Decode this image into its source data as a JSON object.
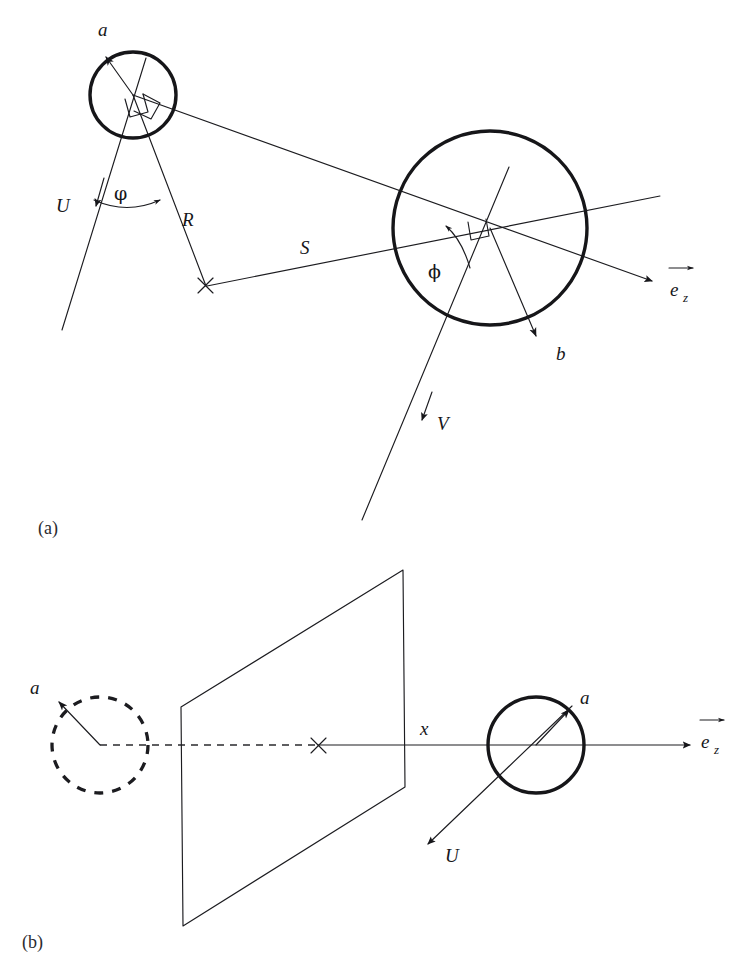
{
  "figure": {
    "type": "diagram",
    "background_color": "#ffffff",
    "ink_color": "#16161a"
  },
  "panels": [
    {
      "id": "a",
      "caption": "(a)",
      "caption_pos": {
        "x": 52,
        "y": 534
      },
      "elements": {
        "small_circle": {
          "cx": 133,
          "cy": 95,
          "r": 43,
          "style": "solid-thick"
        },
        "large_circle": {
          "cx": 490,
          "cy": 228,
          "r": 97,
          "style": "solid-thick"
        },
        "cross_marker": {
          "x": 205,
          "y": 285,
          "size": 9
        },
        "vector_a": {
          "from": [
            133,
            95
          ],
          "to": [
            104,
            55
          ],
          "label": "a",
          "label_pos": {
            "x": 100,
            "y": 33
          }
        },
        "vector_b": {
          "from": [
            490,
            228
          ],
          "to": [
            537,
            338
          ],
          "label": "b",
          "label_pos": {
            "x": 556,
            "y": 356
          }
        },
        "vector_U": {
          "label": "U",
          "label_pos": {
            "x": 63,
            "y": 207
          },
          "arrow_at": [
            95,
            207
          ]
        },
        "vector_V": {
          "label": "V",
          "label_pos": {
            "x": 437,
            "y": 425
          },
          "arrow_at": [
            421,
            424
          ]
        },
        "vector_ez": {
          "label": "e",
          "subscript": "z",
          "label_pos": {
            "x": 676,
            "y": 296
          },
          "arrow_tip": [
            660,
            283
          ]
        },
        "segment_R": {
          "from": [
            133,
            95
          ],
          "to": [
            205,
            285
          ],
          "label": "R",
          "label_pos": {
            "x": 188,
            "y": 219
          }
        },
        "segment_S": {
          "from": [
            205,
            285
          ],
          "to": [
            490,
            228
          ],
          "label": "S",
          "label_pos": {
            "x": 305,
            "y": 248
          }
        },
        "angle_phi_small": {
          "label": "φ",
          "label_pos": {
            "x": 120,
            "y": 196
          }
        },
        "angle_phi_large": {
          "label": "ϕ",
          "label_pos": {
            "x": 437,
            "y": 272
          }
        },
        "right_angle_marks": 3
      }
    },
    {
      "id": "b",
      "caption": "(b)",
      "caption_pos": {
        "x": 24,
        "y": 945
      },
      "elements": {
        "dashed_circle": {
          "cx": 100,
          "cy": 745,
          "r": 48,
          "style": "dashed-thick"
        },
        "solid_circle": {
          "cx": 536,
          "cy": 745,
          "r": 48,
          "style": "solid-thick"
        },
        "cross_marker": {
          "x": 318,
          "y": 745,
          "size": 9
        },
        "plane_parallelogram": {
          "points": [
            [
              403,
              570
            ],
            [
              405,
              787
            ],
            [
              183,
              926
            ],
            [
              181,
              707
            ]
          ]
        },
        "axis_label_x": {
          "label": "x",
          "label_pos": {
            "x": 422,
            "y": 735
          }
        },
        "vector_ez": {
          "label": "e",
          "subscript": "z",
          "label_pos": {
            "x": 706,
            "y": 748
          },
          "arrow_tip": [
            690,
            745
          ]
        },
        "vector_a_left": {
          "from": [
            100,
            745
          ],
          "to": [
            57,
            700
          ],
          "label": "a",
          "label_pos": {
            "x": 34,
            "y": 689
          }
        },
        "vector_a_right": {
          "from": [
            536,
            745
          ],
          "to": [
            570,
            708
          ],
          "label": "a",
          "label_pos": {
            "x": 583,
            "y": 700
          }
        },
        "vector_U": {
          "label": "U",
          "label_pos": {
            "x": 448,
            "y": 858
          },
          "arrow_tip": [
            424,
            846
          ]
        }
      }
    }
  ],
  "labels": {
    "a_vector": "a",
    "b_vector": "b",
    "U_vector": "U",
    "V_vector": "V",
    "R_segment": "R",
    "S_segment": "S",
    "x_axis": "x",
    "e_base": "e",
    "z_subscript": "z",
    "phi_small": "φ",
    "phi_large": "ϕ",
    "panel_a": "(a)",
    "panel_b": "(b)"
  }
}
